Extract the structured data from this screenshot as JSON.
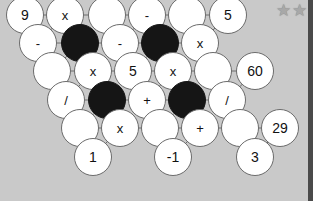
{
  "puzzle": {
    "rating_stars": 2,
    "star_icon": "star-icon",
    "cells": [
      {
        "row": 0,
        "x": 25,
        "y": 15,
        "type": "clue",
        "value": "9"
      },
      {
        "row": 0,
        "x": 65,
        "y": 15,
        "type": "op",
        "value": "x"
      },
      {
        "row": 0,
        "x": 107,
        "y": 15,
        "type": "empty",
        "value": ""
      },
      {
        "row": 0,
        "x": 147,
        "y": 15,
        "type": "op",
        "value": "-"
      },
      {
        "row": 0,
        "x": 187,
        "y": 15,
        "type": "empty",
        "value": ""
      },
      {
        "row": 0,
        "x": 228,
        "y": 15,
        "type": "clue",
        "value": "5"
      },
      {
        "row": 1,
        "x": 38,
        "y": 43,
        "type": "op",
        "value": "-"
      },
      {
        "row": 1,
        "x": 80,
        "y": 43,
        "type": "black",
        "value": ""
      },
      {
        "row": 1,
        "x": 120,
        "y": 43,
        "type": "op",
        "value": "-"
      },
      {
        "row": 1,
        "x": 160,
        "y": 43,
        "type": "black",
        "value": ""
      },
      {
        "row": 1,
        "x": 200,
        "y": 43,
        "type": "op",
        "value": "x"
      },
      {
        "row": 2,
        "x": 52,
        "y": 71,
        "type": "empty",
        "value": ""
      },
      {
        "row": 2,
        "x": 93,
        "y": 71,
        "type": "op",
        "value": "x"
      },
      {
        "row": 2,
        "x": 133,
        "y": 71,
        "type": "clue",
        "value": "5"
      },
      {
        "row": 2,
        "x": 173,
        "y": 71,
        "type": "op",
        "value": "x"
      },
      {
        "row": 2,
        "x": 213,
        "y": 71,
        "type": "empty",
        "value": ""
      },
      {
        "row": 2,
        "x": 255,
        "y": 71,
        "type": "clue",
        "value": "60"
      },
      {
        "row": 3,
        "x": 66,
        "y": 100,
        "type": "op",
        "value": "/"
      },
      {
        "row": 3,
        "x": 107,
        "y": 100,
        "type": "black",
        "value": ""
      },
      {
        "row": 3,
        "x": 147,
        "y": 100,
        "type": "op",
        "value": "+"
      },
      {
        "row": 3,
        "x": 187,
        "y": 100,
        "type": "black",
        "value": ""
      },
      {
        "row": 3,
        "x": 227,
        "y": 100,
        "type": "op",
        "value": "/"
      },
      {
        "row": 4,
        "x": 80,
        "y": 128,
        "type": "empty",
        "value": ""
      },
      {
        "row": 4,
        "x": 120,
        "y": 128,
        "type": "op",
        "value": "x"
      },
      {
        "row": 4,
        "x": 160,
        "y": 128,
        "type": "empty",
        "value": ""
      },
      {
        "row": 4,
        "x": 200,
        "y": 128,
        "type": "op",
        "value": "+"
      },
      {
        "row": 4,
        "x": 240,
        "y": 128,
        "type": "empty",
        "value": ""
      },
      {
        "row": 4,
        "x": 280,
        "y": 128,
        "type": "clue",
        "value": "29"
      },
      {
        "row": 5,
        "x": 93,
        "y": 157,
        "type": "clue",
        "value": "1"
      },
      {
        "row": 5,
        "x": 173,
        "y": 157,
        "type": "clue",
        "value": "-1"
      },
      {
        "row": 5,
        "x": 255,
        "y": 157,
        "type": "clue",
        "value": "3"
      }
    ],
    "lines": [
      [
        25,
        15,
        228,
        15
      ],
      [
        38,
        43,
        200,
        43
      ],
      [
        52,
        71,
        255,
        71
      ],
      [
        66,
        100,
        227,
        100
      ],
      [
        80,
        128,
        280,
        128
      ],
      [
        25,
        15,
        93,
        157
      ],
      [
        107,
        15,
        173,
        157
      ],
      [
        187,
        15,
        255,
        157
      ],
      [
        65,
        15,
        38,
        43
      ],
      [
        147,
        15,
        120,
        43
      ],
      [
        228,
        15,
        200,
        43
      ],
      [
        80,
        43,
        52,
        71
      ],
      [
        160,
        43,
        133,
        71
      ],
      [
        93,
        71,
        66,
        100
      ],
      [
        173,
        71,
        147,
        100
      ],
      [
        255,
        71,
        227,
        100
      ],
      [
        107,
        100,
        80,
        128
      ],
      [
        187,
        100,
        160,
        128
      ],
      [
        120,
        128,
        93,
        157
      ],
      [
        200,
        128,
        173,
        157
      ],
      [
        280,
        128,
        255,
        157
      ]
    ]
  }
}
